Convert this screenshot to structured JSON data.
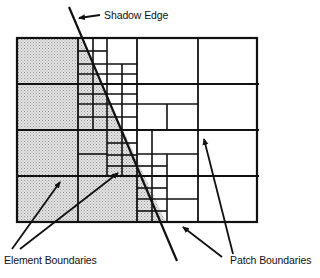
{
  "diagram": {
    "labels": {
      "shadow_edge": "Shadow Edge",
      "element_boundaries": "Element Boundaries",
      "patch_boundaries": "Patch Boundaries"
    },
    "colors": {
      "line": "#111111",
      "shadow_fill": "#d4d4d4",
      "background": "#ffffff"
    },
    "patch_grid": {
      "columns_x": [
        17,
        78,
        137,
        198,
        257
      ],
      "rows_y": [
        38,
        84,
        130,
        176,
        222
      ]
    }
  }
}
